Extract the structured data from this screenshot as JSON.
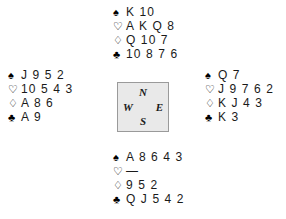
{
  "deal": {
    "suit_symbols": {
      "spades": "♠",
      "hearts": "♡",
      "diamonds": "♢",
      "clubs": "♣"
    },
    "void_marker": "—",
    "compass": {
      "north": "N",
      "south": "S",
      "west": "W",
      "east": "E"
    },
    "hands": {
      "north": {
        "label": "North",
        "spades": "K 10",
        "hearts": "A K Q 8",
        "diamonds": "Q 10 7",
        "clubs": "10 8 7 6"
      },
      "west": {
        "label": "West",
        "spades": "J 9 5 2",
        "hearts": "10 5 4 3",
        "diamonds": "A 8 6",
        "clubs": "A 9"
      },
      "east": {
        "label": "East",
        "spades": "Q 7",
        "hearts": "J 9 7 6 2",
        "diamonds": "K J 4 3",
        "clubs": "K 3"
      },
      "south": {
        "label": "South",
        "spades": "A 8 6 4 3",
        "hearts": "—",
        "diamonds": "9 5 2",
        "clubs": "Q J 5 4 2"
      }
    }
  }
}
